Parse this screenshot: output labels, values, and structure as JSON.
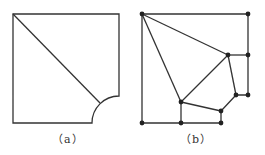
{
  "figure": {
    "stroke_color": "#333333",
    "node_color": "#222222",
    "panels": [
      {
        "id": "a",
        "caption": "（a）",
        "description": "Square plate with quarter-circle cutout at bottom-right corner and a diagonal line"
      },
      {
        "id": "b",
        "caption": "（b）",
        "description": "Meshed plate with nodes and polygonal elements approximating cutout",
        "nodes": [
          [
            142,
            14
          ],
          [
            248,
            14
          ],
          [
            228,
            55
          ],
          [
            248,
            55
          ],
          [
            236,
            95
          ],
          [
            248,
            95
          ],
          [
            221,
            111
          ],
          [
            181,
            102
          ],
          [
            142,
            123
          ],
          [
            181,
            123
          ],
          [
            221,
            123
          ]
        ]
      }
    ]
  }
}
